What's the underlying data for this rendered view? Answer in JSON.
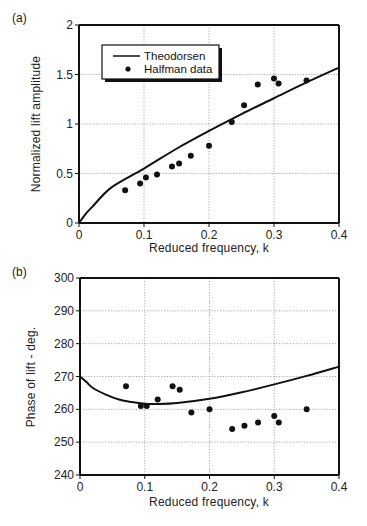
{
  "chart_data": [
    {
      "panel": "(a)",
      "type": "line+scatter",
      "title": "",
      "xlabel": "Reduced frequency, k",
      "ylabel": "Normalized lift amplitude",
      "xlim": [
        0,
        0.4
      ],
      "ylim": [
        0,
        2
      ],
      "xticks": [
        "0",
        "0.1",
        "0.2",
        "0.3",
        "0.4"
      ],
      "yticks": [
        "0",
        "0.5",
        "1",
        "1.5",
        "2"
      ],
      "grid": true,
      "legend_position": "upper-left",
      "series": [
        {
          "name": "Theodorsen",
          "style": "line",
          "x": [
            0,
            0.01,
            0.02,
            0.05,
            0.1,
            0.15,
            0.2,
            0.25,
            0.3,
            0.35,
            0.4
          ],
          "y": [
            0,
            0.09,
            0.16,
            0.36,
            0.55,
            0.75,
            0.93,
            1.1,
            1.26,
            1.42,
            1.57
          ]
        },
        {
          "name": "Halfman data",
          "style": "scatter",
          "x": [
            0.071,
            0.094,
            0.103,
            0.12,
            0.143,
            0.154,
            0.172,
            0.2,
            0.235,
            0.254,
            0.275,
            0.3,
            0.307,
            0.35
          ],
          "y": [
            0.33,
            0.4,
            0.46,
            0.49,
            0.57,
            0.6,
            0.68,
            0.78,
            1.02,
            1.19,
            1.4,
            1.46,
            1.41,
            1.44
          ]
        }
      ]
    },
    {
      "panel": "(b)",
      "type": "line+scatter",
      "title": "",
      "xlabel": "Reduced frequency, k",
      "ylabel": "Phase of lift - deg.",
      "xlim": [
        0,
        0.4
      ],
      "ylim": [
        240,
        300
      ],
      "xticks": [
        "0",
        "0.1",
        "0.2",
        "0.3",
        "0.4"
      ],
      "yticks": [
        "240",
        "250",
        "260",
        "270",
        "280",
        "290",
        "300"
      ],
      "grid": true,
      "series": [
        {
          "name": "Theodorsen",
          "style": "line",
          "x": [
            0,
            0.01,
            0.02,
            0.04,
            0.06,
            0.08,
            0.1,
            0.12,
            0.15,
            0.2,
            0.25,
            0.3,
            0.35,
            0.4
          ],
          "y": [
            270,
            268.3,
            266.5,
            264.5,
            263.0,
            262.2,
            261.7,
            261.6,
            261.9,
            263.2,
            265.2,
            267.6,
            270.2,
            273.0
          ]
        },
        {
          "name": "Halfman data",
          "style": "scatter",
          "x": [
            0.071,
            0.094,
            0.103,
            0.12,
            0.143,
            0.154,
            0.172,
            0.2,
            0.235,
            0.254,
            0.275,
            0.3,
            0.307,
            0.35
          ],
          "y": [
            267,
            261,
            261,
            263,
            267,
            266,
            259,
            260,
            254,
            255,
            256,
            258,
            256,
            260
          ]
        }
      ]
    }
  ],
  "labels": {
    "panel_a": "(a)",
    "panel_b": "(b)",
    "legend_line": "Theodorsen",
    "legend_dot": "Halfman data"
  },
  "colors": {
    "ink": "#111111",
    "grid": "#888888",
    "background": "#ffffff"
  }
}
